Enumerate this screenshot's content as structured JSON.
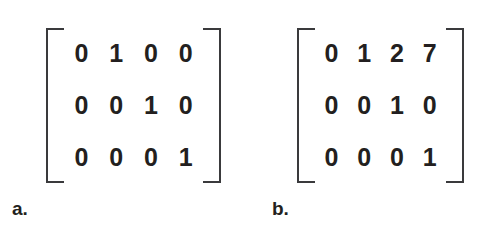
{
  "figure": {
    "background_color": "#ffffff",
    "digit_color": "#231f20",
    "bracket_color": "#3a3a3c",
    "items": [
      {
        "label": "a.",
        "matrix": {
          "rows": 3,
          "cols": 4,
          "values": [
            [
              "0",
              "1",
              "0",
              "0"
            ],
            [
              "0",
              "0",
              "1",
              "0"
            ],
            [
              "0",
              "0",
              "0",
              "1"
            ]
          ]
        }
      },
      {
        "label": "b.",
        "matrix": {
          "rows": 3,
          "cols": 4,
          "values": [
            [
              "0",
              "1",
              "2",
              "7"
            ],
            [
              "0",
              "0",
              "1",
              "0"
            ],
            [
              "0",
              "0",
              "0",
              "1"
            ]
          ]
        }
      }
    ]
  }
}
